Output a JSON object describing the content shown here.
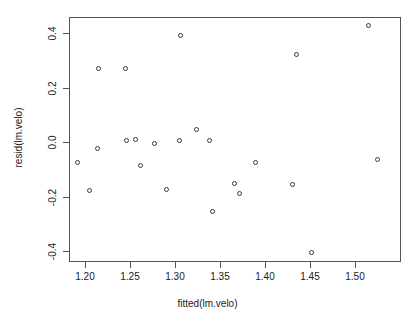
{
  "chart_data": {
    "type": "scatter",
    "title": "",
    "xlabel": "fitted(lm.velo)",
    "ylabel": "resid(lm.velo)",
    "xlim": [
      1.1822,
      1.5511
    ],
    "ylim": [
      -0.4386,
      0.4596
    ],
    "xticks": [
      1.2,
      1.25,
      1.3,
      1.35,
      1.4,
      1.45,
      1.5
    ],
    "xticklabels": [
      "1.20",
      "1.25",
      "1.30",
      "1.35",
      "1.40",
      "1.45",
      "1.50"
    ],
    "yticks": [
      -0.4,
      -0.2,
      0.0,
      0.2,
      0.4
    ],
    "yticklabels": [
      "-0.4",
      "-0.2",
      "0.0",
      "0.2",
      "0.4"
    ],
    "grid": false,
    "legend": null,
    "marker": "open-circle",
    "marker_color": "#3a3a3a",
    "frame_color": "#555555",
    "background": "#ffffff",
    "points": [
      {
        "x": 1.1911,
        "y": -0.0702
      },
      {
        "x": 1.2044,
        "y": -0.1754
      },
      {
        "x": 1.2133,
        "y": -0.0211
      },
      {
        "x": 1.2144,
        "y": 0.2737
      },
      {
        "x": 1.2444,
        "y": 0.2737
      },
      {
        "x": 1.2456,
        "y": 0.007
      },
      {
        "x": 1.2556,
        "y": 0.014
      },
      {
        "x": 1.2611,
        "y": -0.0842
      },
      {
        "x": 1.2767,
        "y": -0.0035
      },
      {
        "x": 1.29,
        "y": -0.1719
      },
      {
        "x": 1.3044,
        "y": 0.0105
      },
      {
        "x": 1.3056,
        "y": 0.393
      },
      {
        "x": 1.3233,
        "y": 0.0491
      },
      {
        "x": 1.3378,
        "y": 0.007
      },
      {
        "x": 1.3411,
        "y": -0.2526
      },
      {
        "x": 1.3656,
        "y": -0.1474
      },
      {
        "x": 1.3711,
        "y": -0.186
      },
      {
        "x": 1.3889,
        "y": -0.0702
      },
      {
        "x": 1.43,
        "y": -0.1544
      },
      {
        "x": 1.4344,
        "y": 0.3228
      },
      {
        "x": 1.4511,
        "y": -0.4035
      },
      {
        "x": 1.5144,
        "y": 0.4316
      },
      {
        "x": 1.5244,
        "y": -0.0596
      }
    ]
  }
}
